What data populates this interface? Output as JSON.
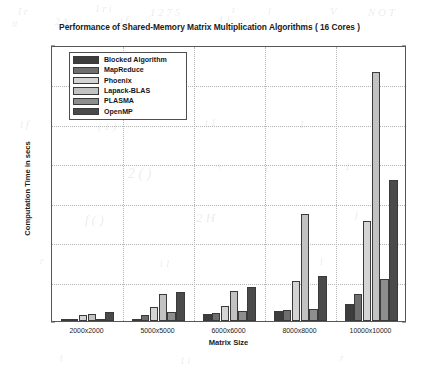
{
  "chart_data": {
    "type": "bar",
    "title": "Performance of Shared-Memory Matrix Multiplication Algorithms ( 16 Cores )",
    "xlabel": "Matrix Size",
    "ylabel": "Computation Time in secs",
    "categories": [
      "2000x2000",
      "5000x5000",
      "6000x6000",
      "8000x8000",
      "10000x10000"
    ],
    "ylim": [
      0,
      1400
    ],
    "yticks": [
      0,
      200,
      400,
      600,
      800,
      1000,
      1200,
      1400
    ],
    "grid": true,
    "legend_position": "upper left (inside axes)",
    "series": [
      {
        "name": "Blocked Algorithm",
        "color": "#3d3d3d",
        "values": [
          8,
          10,
          35,
          52,
          85
        ]
      },
      {
        "name": "MapReduce",
        "color": "#6e6e6e",
        "values": [
          12,
          30,
          42,
          55,
          135
        ]
      },
      {
        "name": "Phoenix",
        "color": "#d4d4d4",
        "values": [
          28,
          70,
          78,
          205,
          505
        ]
      },
      {
        "name": "Lapack-BLAS",
        "color": "#c2c2c2",
        "values": [
          35,
          135,
          150,
          545,
          1265
        ]
      },
      {
        "name": "PLASMA",
        "color": "#8e8e8e",
        "values": [
          10,
          48,
          52,
          60,
          215
        ]
      },
      {
        "name": "OpenMP",
        "color": "#4a4a4a",
        "values": [
          45,
          148,
          172,
          230,
          715
        ]
      }
    ]
  },
  "scan_artifacts": [
    {
      "text": "I  r",
      "x": 18,
      "y": 6,
      "size": 10
    },
    {
      "text": "1  r  i",
      "x": 95,
      "y": 3,
      "size": 10
    },
    {
      "text": "1 2 7 5",
      "x": 150,
      "y": 6,
      "size": 11
    },
    {
      "text": "t",
      "x": 232,
      "y": 4,
      "size": 10
    },
    {
      "text": "l",
      "x": 268,
      "y": 6,
      "size": 10
    },
    {
      "text": "V",
      "x": 330,
      "y": 5,
      "size": 11
    },
    {
      "text": "N O T",
      "x": 368,
      "y": 6,
      "size": 11
    },
    {
      "text": "it",
      "x": 12,
      "y": 18,
      "size": 10
    },
    {
      "text": "2 A",
      "x": 55,
      "y": 16,
      "size": 10
    },
    {
      "text": "i f",
      "x": 120,
      "y": 15,
      "size": 10
    },
    {
      "text": "4 1",
      "x": 218,
      "y": 14,
      "size": 10
    },
    {
      "text": "t i",
      "x": 300,
      "y": 15,
      "size": 10
    },
    {
      "text": "l f",
      "x": 20,
      "y": 118,
      "size": 11
    },
    {
      "text": "( 1  )",
      "x": 98,
      "y": 120,
      "size": 11
    },
    {
      "text": "t  1",
      "x": 205,
      "y": 116,
      "size": 11
    },
    {
      "text": "I",
      "x": 300,
      "y": 118,
      "size": 11
    },
    {
      "text": "2 ( )",
      "x": 128,
      "y": 166,
      "size": 14
    },
    {
      "text": "+",
      "x": 215,
      "y": 160,
      "size": 12
    },
    {
      "text": "i",
      "x": 265,
      "y": 162,
      "size": 11
    },
    {
      "text": "1",
      "x": 345,
      "y": 160,
      "size": 11
    },
    {
      "text": "f ( )",
      "x": 85,
      "y": 212,
      "size": 13
    },
    {
      "text": "2 H",
      "x": 196,
      "y": 210,
      "size": 13
    },
    {
      "text": "l",
      "x": 300,
      "y": 212,
      "size": 11
    },
    {
      "text": "j",
      "x": 355,
      "y": 208,
      "size": 11
    },
    {
      "text": "r",
      "x": 40,
      "y": 255,
      "size": 10
    },
    {
      "text": "i 1",
      "x": 160,
      "y": 258,
      "size": 10
    },
    {
      "text": "l",
      "x": 320,
      "y": 256,
      "size": 10
    },
    {
      "text": "t",
      "x": 60,
      "y": 352,
      "size": 10
    },
    {
      "text": "1  i",
      "x": 180,
      "y": 355,
      "size": 10
    },
    {
      "text": "r",
      "x": 340,
      "y": 352,
      "size": 10
    }
  ]
}
